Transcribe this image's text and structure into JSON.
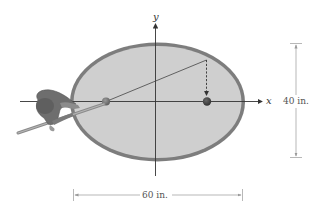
{
  "diagram": {
    "type": "elliptical billiard table",
    "axes": {
      "x_label": "x",
      "y_label": "y"
    },
    "dimensions": {
      "width_label": "60 in.",
      "height_label": "40 in."
    },
    "elements": [
      {
        "name": "elliptical-table",
        "description": "Elliptical pool table with gray felt and darker rim"
      },
      {
        "name": "cue-ball",
        "position": "left focus on x-axis"
      },
      {
        "name": "target-ball",
        "position": "right focus on x-axis"
      },
      {
        "name": "shot-path",
        "description": "line from cue ball to rim, dashed arrow down to target ball"
      },
      {
        "name": "hand-with-cue",
        "description": "hand holding cue stick at left"
      }
    ],
    "colors": {
      "felt": "#cfcfcf",
      "rim": "#7a7a7a",
      "ball": "#555555",
      "axis": "#333333",
      "dimension": "#8a8a8a"
    }
  }
}
